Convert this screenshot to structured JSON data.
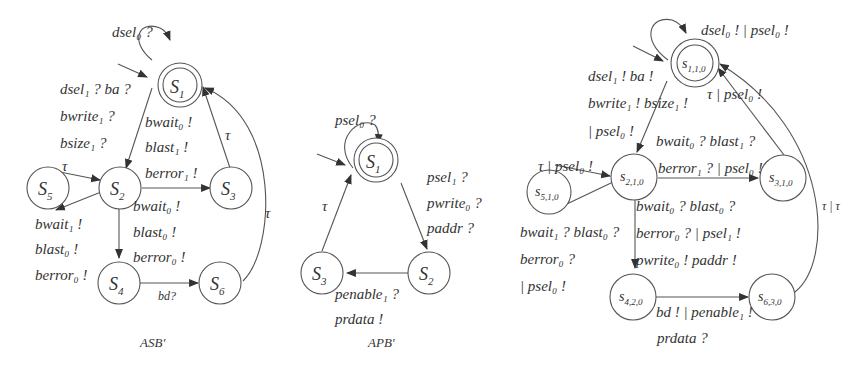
{
  "diagrams": [
    {
      "caption": "ASB'",
      "states": [
        {
          "id": "S1",
          "main": "S",
          "sub": "1",
          "initial": true,
          "accepting": true
        },
        {
          "id": "S2",
          "main": "S",
          "sub": "2"
        },
        {
          "id": "S3",
          "main": "S",
          "sub": "3"
        },
        {
          "id": "S4",
          "main": "S",
          "sub": "4"
        },
        {
          "id": "S5",
          "main": "S",
          "sub": "5"
        },
        {
          "id": "S6",
          "main": "S",
          "sub": "6"
        }
      ],
      "transitions": {
        "s1_self": "dsel₀ ?",
        "s1_s2": [
          "dsel₁ ? ba ?",
          "bwrite₁ ?",
          "bsize₁ ?"
        ],
        "s2_s3": [
          "bwait₀ !",
          "blast₁ !",
          "berror₁ !"
        ],
        "s3_s1": "τ",
        "s5_s2": "τ",
        "s2_s5": [
          "bwait₁ !",
          "blast₀ !",
          "berror₀ !"
        ],
        "s2_s4": [
          "bwait₀ !",
          "blast₀ !",
          "berror₀ !"
        ],
        "s4_s6": "bd?",
        "s6_s1": "τ"
      }
    },
    {
      "caption": "APB'",
      "states": [
        {
          "id": "S1",
          "main": "S",
          "sub": "1",
          "initial": true,
          "accepting": true
        },
        {
          "id": "S2",
          "main": "S",
          "sub": "2"
        },
        {
          "id": "S3",
          "main": "S",
          "sub": "3"
        }
      ],
      "transitions": {
        "s1_self": "psel₀ ?",
        "s1_s2": [
          "psel₁ ?",
          "pwrite₀ ?",
          "paddr ?"
        ],
        "s2_s3": [
          "penable₁ ?",
          "prdata !"
        ],
        "s3_s1": "τ"
      }
    },
    {
      "caption": "",
      "states": [
        {
          "id": "s110",
          "main": "s",
          "sub": "1,1,0",
          "initial": true,
          "accepting": true
        },
        {
          "id": "s210",
          "main": "s",
          "sub": "2,1,0"
        },
        {
          "id": "s310",
          "main": "s",
          "sub": "3,1,0"
        },
        {
          "id": "s510",
          "main": "s",
          "sub": "5,1,0"
        },
        {
          "id": "s420",
          "main": "s",
          "sub": "4,2,0"
        },
        {
          "id": "s630",
          "main": "s",
          "sub": "6,3,0"
        }
      ],
      "transitions": {
        "s110_self": "dsel₀ ! | psel₀ !",
        "s110_s210": [
          "dsel₁ ! ba !",
          "bwrite₁ ! bsize₁ !",
          "| psel₀ !"
        ],
        "s210_s310": [
          "bwait₀ ? blast₁ ?",
          "berror₁ ? | psel₀ !"
        ],
        "s310_s110": "τ | psel₀ !",
        "s510_s210": "τ | psel₀ !",
        "s210_s510": [
          "bwait₁ ? blast₀ ?",
          "berror₀ ?",
          "| psel₀ !"
        ],
        "s210_s420": [
          "bwait₀ ? blast₀ ?",
          "berror₀ ? | psel₁ !",
          "pwrite₀ ! paddr !"
        ],
        "s420_s630": [
          "bd ! | penable₁ !",
          "prdata ?"
        ],
        "s630_s110": "τ | τ"
      }
    }
  ]
}
